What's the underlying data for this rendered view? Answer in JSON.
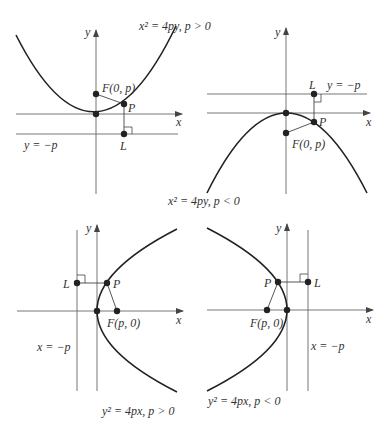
{
  "figure": {
    "panels": [
      {
        "id": "up",
        "caption": "x² = 4py, p > 0",
        "focus_label": "F(0, p)",
        "point_label": "P",
        "directrix_point_label": "L",
        "directrix_label": "y = −p",
        "x_axis_label": "x",
        "y_axis_label": "y"
      },
      {
        "id": "down",
        "caption": "x² = 4py, p < 0",
        "focus_label": "F(0, p)",
        "point_label": "P",
        "directrix_point_label": "L",
        "directrix_label": "y = −p",
        "x_axis_label": "x",
        "y_axis_label": "y"
      },
      {
        "id": "right",
        "caption": "y² = 4px, p > 0",
        "focus_label": "F(p, 0)",
        "point_label": "P",
        "directrix_point_label": "L",
        "directrix_label": "x = −p",
        "x_axis_label": "x",
        "y_axis_label": "y"
      },
      {
        "id": "left",
        "caption": "y² = 4px, p < 0",
        "focus_label": "F(p, 0)",
        "point_label": "P",
        "directrix_point_label": "L",
        "directrix_label": "x = −p",
        "x_axis_label": "x",
        "y_axis_label": "y"
      }
    ],
    "colors": {
      "curve": "#222222",
      "axis": "#555555",
      "text": "#333333"
    }
  }
}
